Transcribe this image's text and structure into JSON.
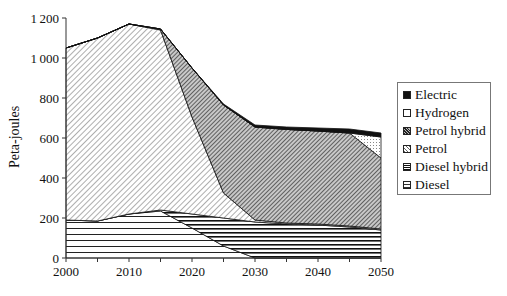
{
  "chart_data": {
    "type": "area",
    "stacked": true,
    "title": "",
    "xlabel": "",
    "ylabel": "Peta-joules",
    "x": [
      2000,
      2005,
      2010,
      2015,
      2020,
      2025,
      2030,
      2035,
      2040,
      2045,
      2050
    ],
    "x_ticks": [
      "2000",
      "2010",
      "2020",
      "2030",
      "2040",
      "2050"
    ],
    "y_ticks": [
      "0",
      "200",
      "400",
      "600",
      "800",
      "1000",
      "1200"
    ],
    "ylim": [
      0,
      1200
    ],
    "xlim": [
      2000,
      2050
    ],
    "grid": false,
    "legend_position": "right",
    "series": [
      {
        "name": "Diesel",
        "pattern": "sparse-horizontal",
        "values": [
          190,
          185,
          220,
          235,
          150,
          60,
          0,
          0,
          0,
          0,
          0
        ]
      },
      {
        "name": "Diesel hybrid",
        "pattern": "dense-horizontal",
        "values": [
          0,
          0,
          0,
          5,
          70,
          140,
          180,
          170,
          165,
          155,
          140
        ]
      },
      {
        "name": "Petrol",
        "pattern": "light-diagonal",
        "values": [
          860,
          915,
          950,
          900,
          485,
          125,
          10,
          5,
          5,
          5,
          5
        ]
      },
      {
        "name": "Petrol hybrid",
        "pattern": "dark-diagonal",
        "values": [
          0,
          0,
          0,
          5,
          245,
          440,
          465,
          468,
          465,
          465,
          355
        ]
      },
      {
        "name": "Hydrogen",
        "pattern": "dotted",
        "values": [
          0,
          0,
          0,
          0,
          0,
          0,
          0,
          0,
          0,
          0,
          105
        ]
      },
      {
        "name": "Electric",
        "pattern": "solid-black",
        "values": [
          0,
          0,
          0,
          0,
          0,
          5,
          10,
          12,
          15,
          20,
          20
        ]
      }
    ]
  },
  "legend": {
    "items": [
      {
        "label": "Electric",
        "pattern": "solid-black"
      },
      {
        "label": "Hydrogen",
        "pattern": "dotted"
      },
      {
        "label": "Petrol hybrid",
        "pattern": "dark-diagonal"
      },
      {
        "label": "Petrol",
        "pattern": "light-diagonal"
      },
      {
        "label": "Diesel hybrid",
        "pattern": "dense-horizontal"
      },
      {
        "label": "Diesel",
        "pattern": "sparse-horizontal"
      }
    ]
  },
  "colors": {
    "ink": "#111111",
    "background": "#ffffff"
  }
}
